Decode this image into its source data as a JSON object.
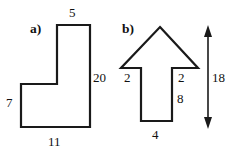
{
  "figure": {
    "background_color": "#ffffff",
    "line_color": "#1a1a1a",
    "text_color": "#111111",
    "parts": [
      {
        "key": "a",
        "label": "a)",
        "shape_name": "l-shape-polygon",
        "dimensions": [
          {
            "name": "top-width",
            "value": "5"
          },
          {
            "name": "right-height",
            "value": "20"
          },
          {
            "name": "left-height",
            "value": "7"
          },
          {
            "name": "bottom-width",
            "value": "11"
          }
        ]
      },
      {
        "key": "b",
        "label": "b)",
        "shape_name": "arrow-pentagon",
        "dimensions": [
          {
            "name": "left-barb-height",
            "value": "2"
          },
          {
            "name": "right-barb-height",
            "value": "2"
          },
          {
            "name": "stem-height",
            "value": "8"
          },
          {
            "name": "stem-width",
            "value": "4"
          },
          {
            "name": "overall-height",
            "value": "18"
          }
        ]
      }
    ]
  },
  "shape_a": {
    "part_label": "a)",
    "top_label": "5",
    "right_label": "20",
    "left_label": "7",
    "bottom_label": "11"
  },
  "shape_b": {
    "part_label": "b)",
    "left_label": "2",
    "right_label": "2",
    "stem_label": "8",
    "bottom_label": "4",
    "height_label": "18"
  }
}
